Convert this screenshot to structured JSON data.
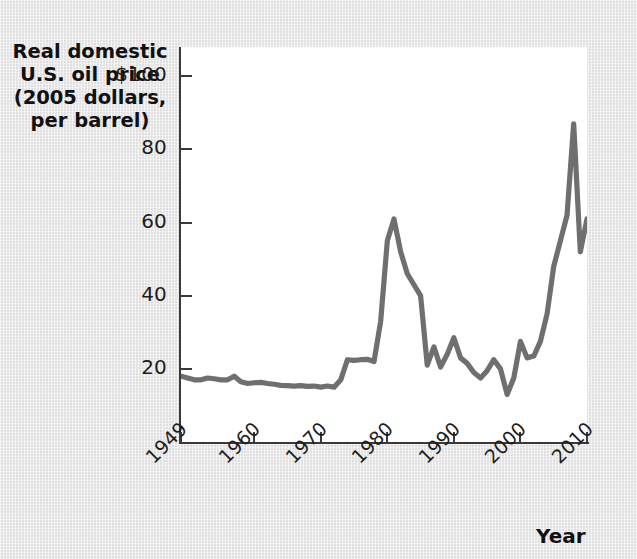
{
  "chart_data": {
    "type": "line",
    "title": "Real domestic U.S. oil price (2005 dollars, per barrel)",
    "ylabel_lines": [
      "Real domestic",
      "U.S. oil price",
      "(2005 dollars,",
      "per barrel)"
    ],
    "xlabel": "Year",
    "xlim": [
      1949,
      2010
    ],
    "ylim": [
      0,
      108
    ],
    "grid": false,
    "legend": null,
    "y_ticks": [
      {
        "value": 100,
        "label": "$100"
      },
      {
        "value": 80,
        "label": "80"
      },
      {
        "value": 60,
        "label": "60"
      },
      {
        "value": 40,
        "label": "40"
      },
      {
        "value": 20,
        "label": "20"
      }
    ],
    "x_ticks": [
      {
        "value": 1949,
        "label": "1949"
      },
      {
        "value": 1960,
        "label": "1960"
      },
      {
        "value": 1970,
        "label": "1970"
      },
      {
        "value": 1980,
        "label": "1980"
      },
      {
        "value": 1990,
        "label": "1990"
      },
      {
        "value": 2000,
        "label": "2000"
      },
      {
        "value": 2010,
        "label": "2010"
      }
    ],
    "series": [
      {
        "name": "Real domestic U.S. oil price",
        "color": "#6f6f6f",
        "x": [
          1949,
          1950,
          1951,
          1952,
          1953,
          1954,
          1955,
          1956,
          1957,
          1958,
          1959,
          1960,
          1961,
          1962,
          1963,
          1964,
          1965,
          1966,
          1967,
          1968,
          1969,
          1970,
          1971,
          1972,
          1973,
          1974,
          1975,
          1976,
          1977,
          1978,
          1979,
          1980,
          1981,
          1982,
          1983,
          1984,
          1985,
          1986,
          1987,
          1988,
          1989,
          1990,
          1991,
          1992,
          1993,
          1994,
          1995,
          1996,
          1997,
          1998,
          1999,
          2000,
          2001,
          2002,
          2003,
          2004,
          2005,
          2006,
          2007,
          2008,
          2009,
          2010
        ],
        "y": [
          18.0,
          17.5,
          17.0,
          17.0,
          17.5,
          17.3,
          17.0,
          17.0,
          18.0,
          16.5,
          16.0,
          16.2,
          16.3,
          16.0,
          15.8,
          15.5,
          15.4,
          15.3,
          15.4,
          15.2,
          15.3,
          15.0,
          15.3,
          15.0,
          17.0,
          22.5,
          22.3,
          22.5,
          22.6,
          22.0,
          33.0,
          55.0,
          61.0,
          52.0,
          46.0,
          43.0,
          40.0,
          21.0,
          26.0,
          20.5,
          24.0,
          28.5,
          23.0,
          21.5,
          19.0,
          17.5,
          19.5,
          22.5,
          20.0,
          13.0,
          17.5,
          27.5,
          23.0,
          23.5,
          27.5,
          35.0,
          48.0,
          55.0,
          62.0,
          87.0,
          52.0,
          61.0
        ]
      }
    ]
  },
  "axes_geometry": {
    "plot_left_px": 181,
    "plot_top_px": 47,
    "plot_width_px": 406,
    "plot_height_px": 395
  }
}
